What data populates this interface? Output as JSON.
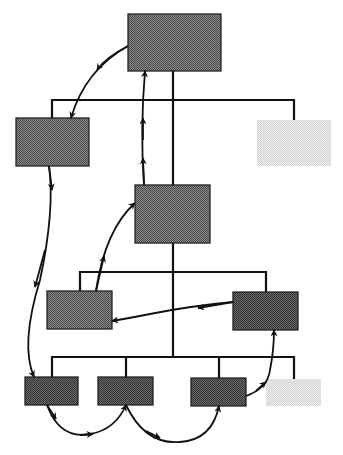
{
  "diagram": {
    "type": "hierarchy-with-flow",
    "colors": {
      "background": "#ffffff",
      "line": "#111111",
      "box_dark": "#5a5a5a",
      "box_medium": "#6e6e6e",
      "box_light": "#e3e3e3"
    },
    "nodes": [
      {
        "id": "root",
        "x": 128,
        "y": 14,
        "w": 93,
        "h": 57,
        "shade": "medium"
      },
      {
        "id": "l1-left",
        "x": 16,
        "y": 118,
        "w": 73,
        "h": 48,
        "shade": "medium"
      },
      {
        "id": "l1-right",
        "x": 257,
        "y": 120,
        "w": 74,
        "h": 46,
        "shade": "light"
      },
      {
        "id": "l2-center",
        "x": 135,
        "y": 185,
        "w": 75,
        "h": 58,
        "shade": "medium"
      },
      {
        "id": "l3-left",
        "x": 47,
        "y": 291,
        "w": 65,
        "h": 38,
        "shade": "medium"
      },
      {
        "id": "l3-right",
        "x": 233,
        "y": 292,
        "w": 65,
        "h": 38,
        "shade": "dark"
      },
      {
        "id": "l4-a",
        "x": 25,
        "y": 377,
        "w": 53,
        "h": 28,
        "shade": "dark"
      },
      {
        "id": "l4-b",
        "x": 98,
        "y": 377,
        "w": 55,
        "h": 28,
        "shade": "dark"
      },
      {
        "id": "l4-c",
        "x": 191,
        "y": 378,
        "w": 55,
        "h": 28,
        "shade": "dark"
      },
      {
        "id": "l4-d",
        "x": 266,
        "y": 379,
        "w": 55,
        "h": 27,
        "shade": "light"
      }
    ],
    "hierarchy_lines": [
      {
        "from": "root",
        "to": [
          "l1-left",
          "l1-right",
          "l2-center"
        ]
      },
      {
        "from": "l2-center",
        "to": [
          "l3-left",
          "l3-right",
          "l4-a",
          "l4-b",
          "l4-c",
          "l4-d"
        ]
      }
    ],
    "flow_arrows": [
      {
        "from": "root",
        "to": "l1-left"
      },
      {
        "from": "l1-left",
        "to": "l4-a"
      },
      {
        "from": "l4-a",
        "to": "l4-b"
      },
      {
        "from": "l4-b",
        "to": "l4-c"
      },
      {
        "from": "l4-c",
        "to": "l3-right"
      },
      {
        "from": "l3-right",
        "to": "l3-left"
      },
      {
        "from": "l3-left",
        "to": "l2-center"
      },
      {
        "from": "l2-center",
        "to": "root"
      }
    ]
  }
}
